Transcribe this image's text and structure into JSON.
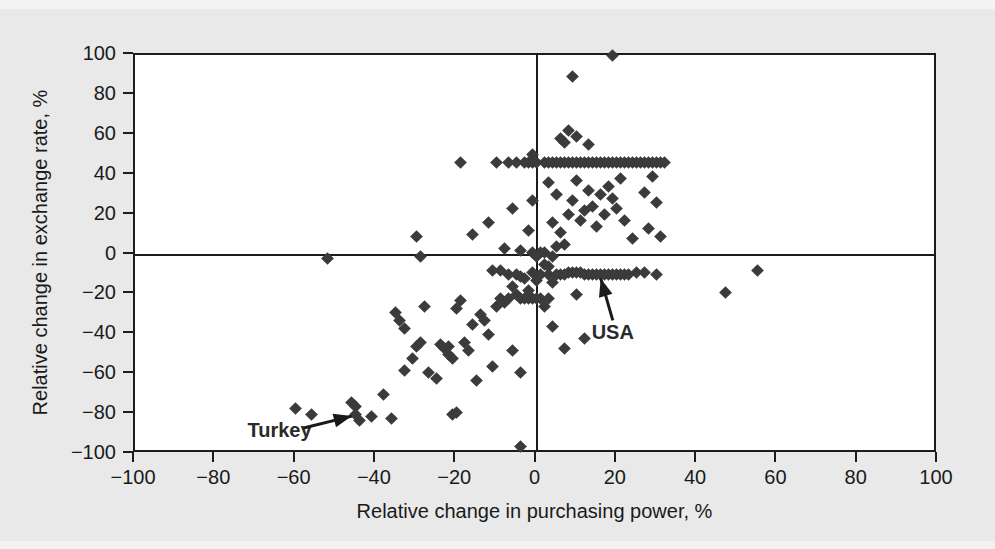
{
  "figure": {
    "background_color": "#e9e9e9",
    "plot_background_color": "#ffffff",
    "marker_color": "#3b3b3b",
    "axis_color": "#1c1c1c"
  },
  "chart_data": {
    "type": "scatter",
    "title": "",
    "xlabel": "Relative change in purchasing power, %",
    "ylabel": "Relative change in exchange rate, %",
    "xlim": [
      -100,
      100
    ],
    "ylim": [
      -100,
      100
    ],
    "xticks": [
      -100,
      -80,
      -60,
      -40,
      -20,
      0,
      20,
      40,
      60,
      80,
      100
    ],
    "yticks": [
      -100,
      -80,
      -60,
      -40,
      -20,
      0,
      20,
      40,
      60,
      80,
      100
    ],
    "xtick_labels": [
      "−100",
      "−80",
      "−60",
      "−40",
      "−20",
      "0",
      "20",
      "40",
      "60",
      "80",
      "100"
    ],
    "ytick_labels": [
      "−100",
      "−80",
      "−60",
      "−40",
      "−20",
      "0",
      "20",
      "40",
      "60",
      "80",
      "100"
    ],
    "grid": false,
    "legend": null,
    "zero_lines": {
      "x": 0,
      "y": 0
    },
    "marker_shape": "diamond",
    "annotations": [
      {
        "text": "Turkey",
        "label_x": -64,
        "label_y": -88,
        "point_x": -45,
        "point_y": -80,
        "arrow_from_x": -58,
        "arrow_from_y": -87,
        "arrow_to_x": -46,
        "arrow_to_y": -81
      },
      {
        "text": "USA",
        "label_x": 19,
        "label_y": -39,
        "point_x": 16,
        "point_y": -10,
        "arrow_from_x": 19,
        "arrow_from_y": -33,
        "arrow_to_x": 16,
        "arrow_to_y": -12
      }
    ],
    "points": [
      [
        -52,
        -2
      ],
      [
        -60,
        -77
      ],
      [
        -56,
        -80
      ],
      [
        -46,
        -74
      ],
      [
        -45,
        -76
      ],
      [
        -45,
        -80
      ],
      [
        -44,
        -83
      ],
      [
        -41,
        -81
      ],
      [
        -38,
        -70
      ],
      [
        -36,
        -82
      ],
      [
        -33,
        -58
      ],
      [
        -31,
        -52
      ],
      [
        -30,
        -46
      ],
      [
        -29,
        -44
      ],
      [
        -35,
        -29
      ],
      [
        -34,
        -33
      ],
      [
        -33,
        -37
      ],
      [
        -30,
        9
      ],
      [
        -29,
        -1
      ],
      [
        -28,
        -26
      ],
      [
        -27,
        -59
      ],
      [
        -25,
        -62
      ],
      [
        -24,
        -45
      ],
      [
        -23,
        -47
      ],
      [
        -22,
        -46
      ],
      [
        -22,
        -50
      ],
      [
        -21,
        -52
      ],
      [
        -21,
        -80
      ],
      [
        -20,
        -79
      ],
      [
        -20,
        -27
      ],
      [
        -19,
        -23
      ],
      [
        -19,
        46
      ],
      [
        -18,
        -44
      ],
      [
        -17,
        -48
      ],
      [
        -16,
        -35
      ],
      [
        -16,
        10
      ],
      [
        -15,
        -63
      ],
      [
        -14,
        -30
      ],
      [
        -13,
        -33
      ],
      [
        -12,
        -40
      ],
      [
        -12,
        16
      ],
      [
        -11,
        -56
      ],
      [
        -11,
        -8
      ],
      [
        -10,
        -26
      ],
      [
        -10,
        46
      ],
      [
        -9,
        -22
      ],
      [
        -9,
        -8
      ],
      [
        -8,
        -24
      ],
      [
        -8,
        3
      ],
      [
        -7,
        -22
      ],
      [
        -7,
        -10
      ],
      [
        -7,
        46
      ],
      [
        -6,
        -48
      ],
      [
        -6,
        -16
      ],
      [
        -6,
        23
      ],
      [
        -5,
        -20
      ],
      [
        -5,
        -10
      ],
      [
        -5,
        46
      ],
      [
        -4,
        -96
      ],
      [
        -4,
        -59
      ],
      [
        -4,
        -22
      ],
      [
        -4,
        -11
      ],
      [
        -4,
        2
      ],
      [
        -3,
        -22
      ],
      [
        -3,
        -12
      ],
      [
        -3,
        46
      ],
      [
        -2,
        -22
      ],
      [
        -2,
        -18
      ],
      [
        -2,
        12
      ],
      [
        -2,
        46
      ],
      [
        -1,
        -22
      ],
      [
        -1,
        -9
      ],
      [
        -1,
        1
      ],
      [
        -1,
        27
      ],
      [
        -1,
        46
      ],
      [
        -1,
        50
      ],
      [
        0,
        -22
      ],
      [
        0,
        -13
      ],
      [
        0,
        -1
      ],
      [
        0,
        46
      ],
      [
        1,
        -22
      ],
      [
        1,
        -10
      ],
      [
        1,
        1
      ],
      [
        2,
        -26
      ],
      [
        2,
        -5
      ],
      [
        2,
        1
      ],
      [
        2,
        46
      ],
      [
        3,
        -22
      ],
      [
        3,
        -10
      ],
      [
        3,
        -6
      ],
      [
        3,
        36
      ],
      [
        3,
        46
      ],
      [
        4,
        -36
      ],
      [
        4,
        -14
      ],
      [
        4,
        -1
      ],
      [
        4,
        16
      ],
      [
        4,
        46
      ],
      [
        5,
        -10
      ],
      [
        5,
        4
      ],
      [
        5,
        30
      ],
      [
        5,
        46
      ],
      [
        6,
        -10
      ],
      [
        6,
        11
      ],
      [
        6,
        46
      ],
      [
        6,
        58
      ],
      [
        7,
        -47
      ],
      [
        7,
        -10
      ],
      [
        7,
        5
      ],
      [
        7,
        46
      ],
      [
        7,
        56
      ],
      [
        8,
        -9
      ],
      [
        8,
        20
      ],
      [
        8,
        46
      ],
      [
        8,
        62
      ],
      [
        9,
        -9
      ],
      [
        9,
        27
      ],
      [
        9,
        46
      ],
      [
        9,
        89
      ],
      [
        10,
        -20
      ],
      [
        10,
        -9
      ],
      [
        10,
        37
      ],
      [
        10,
        46
      ],
      [
        10,
        59
      ],
      [
        11,
        -9
      ],
      [
        11,
        17
      ],
      [
        11,
        46
      ],
      [
        12,
        -42
      ],
      [
        12,
        -10
      ],
      [
        12,
        22
      ],
      [
        12,
        46
      ],
      [
        13,
        -10
      ],
      [
        13,
        32
      ],
      [
        13,
        46
      ],
      [
        13,
        55
      ],
      [
        14,
        -10
      ],
      [
        14,
        24
      ],
      [
        14,
        46
      ],
      [
        15,
        -10
      ],
      [
        15,
        14
      ],
      [
        15,
        46
      ],
      [
        16,
        -10
      ],
      [
        16,
        30
      ],
      [
        16,
        46
      ],
      [
        17,
        -10
      ],
      [
        17,
        20
      ],
      [
        17,
        46
      ],
      [
        18,
        -10
      ],
      [
        18,
        34
      ],
      [
        18,
        46
      ],
      [
        19,
        -10
      ],
      [
        19,
        28
      ],
      [
        19,
        46
      ],
      [
        19,
        100
      ],
      [
        20,
        -10
      ],
      [
        20,
        23
      ],
      [
        20,
        46
      ],
      [
        21,
        -10
      ],
      [
        21,
        38
      ],
      [
        21,
        46
      ],
      [
        22,
        -10
      ],
      [
        22,
        17
      ],
      [
        22,
        46
      ],
      [
        23,
        -10
      ],
      [
        23,
        46
      ],
      [
        24,
        8
      ],
      [
        24,
        46
      ],
      [
        25,
        -9
      ],
      [
        25,
        46
      ],
      [
        26,
        46
      ],
      [
        27,
        -9
      ],
      [
        27,
        31
      ],
      [
        27,
        46
      ],
      [
        28,
        13
      ],
      [
        28,
        46
      ],
      [
        29,
        39
      ],
      [
        29,
        46
      ],
      [
        30,
        -10
      ],
      [
        30,
        26
      ],
      [
        30,
        46
      ],
      [
        31,
        9
      ],
      [
        31,
        46
      ],
      [
        32,
        46
      ],
      [
        47,
        -19
      ],
      [
        55,
        -8
      ]
    ]
  }
}
